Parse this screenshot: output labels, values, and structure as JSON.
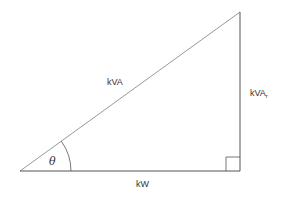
{
  "diagram": {
    "type": "power-triangle",
    "labels": {
      "hypotenuse": "kVA",
      "vertical_side": "kVA",
      "vertical_side_subscript": "r",
      "base": "kW",
      "angle": "θ"
    },
    "colors": {
      "line": "#555555",
      "hypotenuse": "#999999",
      "text": "#333333",
      "background": "#ffffff"
    },
    "vertices": {
      "left": [
        20,
        171
      ],
      "top_right": [
        240,
        12
      ],
      "bottom_right": [
        240,
        171
      ]
    }
  }
}
